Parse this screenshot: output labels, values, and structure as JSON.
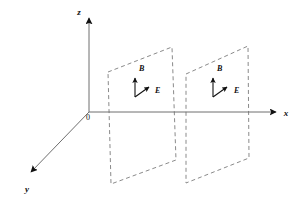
{
  "figure": {
    "background_color": "#ffffff",
    "width": 300,
    "height": 203,
    "axes": {
      "color": "#555555",
      "origin_label": "0",
      "origin": {
        "x": 89,
        "y": 112
      },
      "items": [
        {
          "name": "z",
          "label": "z",
          "label_x": 79,
          "label_y": 15,
          "from": {
            "x": 89,
            "y": 112
          },
          "to": {
            "x": 89,
            "y": 13
          },
          "arrow": "solid-filled"
        },
        {
          "name": "x",
          "label": "x",
          "label_x": 286,
          "label_y": 116,
          "from": {
            "x": 89,
            "y": 112
          },
          "to": {
            "x": 281,
            "y": 112
          },
          "arrow": "solid-filled"
        },
        {
          "name": "y",
          "label": "y",
          "label_x": 27,
          "label_y": 192,
          "from": {
            "x": 89,
            "y": 112
          },
          "to": {
            "x": 26,
            "y": 177
          },
          "arrow": "solid-filled"
        }
      ]
    },
    "planes": {
      "stroke_color": "#8a8a8a",
      "dash_pattern": "4 3",
      "items": [
        {
          "name": "plane-1",
          "corners": [
            {
              "x": 108,
              "y": 72
            },
            {
              "x": 172,
              "y": 47
            },
            {
              "x": 176,
              "y": 160
            },
            {
              "x": 111,
              "y": 184
            }
          ]
        },
        {
          "name": "plane-2",
          "corners": [
            {
              "x": 186,
              "y": 74
            },
            {
              "x": 248,
              "y": 46
            },
            {
              "x": 249,
              "y": 158
            },
            {
              "x": 186,
              "y": 183
            }
          ]
        }
      ]
    },
    "vectors": {
      "color": "#111111",
      "items": [
        {
          "name": "B-field-plane-1",
          "label": "B",
          "label_x": 139,
          "label_y": 71,
          "from": {
            "x": 135,
            "y": 97
          },
          "to": {
            "x": 135,
            "y": 74
          }
        },
        {
          "name": "E-field-plane-1",
          "label": "E",
          "label_x": 155,
          "label_y": 93,
          "from": {
            "x": 135,
            "y": 97
          },
          "to": {
            "x": 152,
            "y": 85
          }
        },
        {
          "name": "B-field-plane-2",
          "label": "B",
          "label_x": 217,
          "label_y": 71,
          "from": {
            "x": 213,
            "y": 97
          },
          "to": {
            "x": 213,
            "y": 74
          }
        },
        {
          "name": "E-field-plane-2",
          "label": "E",
          "label_x": 234,
          "label_y": 93,
          "from": {
            "x": 213,
            "y": 97
          },
          "to": {
            "x": 230,
            "y": 85
          }
        }
      ]
    }
  }
}
